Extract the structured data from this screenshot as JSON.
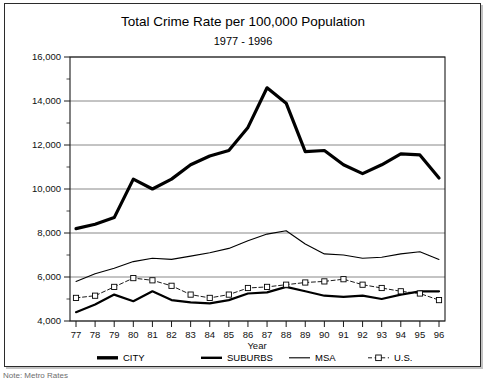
{
  "figure": {
    "title": "Total Crime Rate per 100,000 Population",
    "subtitle": "1977 - 1996",
    "caption_partial": "Note: Metro Rates",
    "border_color": "#2b2b2b",
    "background": "#ffffff"
  },
  "chart_data": {
    "type": "line",
    "title": "Total Crime Rate per 100,000 Population",
    "subtitle": "1977 - 1996",
    "xlabel": "Year",
    "ylabel": "",
    "grid": true,
    "legend_position": "bottom",
    "ylim": [
      4000,
      16000
    ],
    "ytick_step": 2000,
    "yminor_step": 1000,
    "ytick_labels": [
      "4,000",
      "6,000",
      "8,000",
      "10,000",
      "12,000",
      "14,000",
      "16,000"
    ],
    "ytick_values": [
      4000,
      6000,
      8000,
      10000,
      12000,
      14000,
      16000
    ],
    "categories": [
      "77",
      "78",
      "79",
      "80",
      "81",
      "82",
      "83",
      "84",
      "85",
      "86",
      "87",
      "88",
      "89",
      "90",
      "91",
      "92",
      "93",
      "94",
      "95",
      "96"
    ],
    "x": [
      1977,
      1978,
      1979,
      1980,
      1981,
      1982,
      1983,
      1984,
      1985,
      1986,
      1987,
      1988,
      1989,
      1990,
      1991,
      1992,
      1993,
      1994,
      1995,
      1996
    ],
    "series": [
      {
        "name": "CITY",
        "style": "solid",
        "width": 3.2,
        "color": "#000000",
        "marker": "none",
        "values": [
          8200,
          8400,
          8700,
          10450,
          10000,
          10450,
          11100,
          11500,
          11750,
          12800,
          14600,
          13900,
          11700,
          11750,
          11100,
          10700,
          11100,
          11600,
          11550,
          10500
        ]
      },
      {
        "name": "SUBURBS",
        "style": "solid",
        "width": 2.2,
        "color": "#000000",
        "marker": "none",
        "values": [
          4400,
          4750,
          5200,
          4900,
          5350,
          4950,
          4850,
          4800,
          4950,
          5250,
          5300,
          5550,
          5350,
          5150,
          5100,
          5150,
          5000,
          5200,
          5350,
          5350
        ]
      },
      {
        "name": "MSA",
        "style": "solid",
        "width": 1.1,
        "color": "#000000",
        "marker": "none",
        "values": [
          5800,
          6150,
          6400,
          6700,
          6850,
          6800,
          6950,
          7100,
          7300,
          7650,
          7950,
          8100,
          7500,
          7050,
          7000,
          6850,
          6900,
          7050,
          7150,
          6800
        ]
      },
      {
        "name": "U.S.",
        "style": "dashed",
        "width": 0.9,
        "color": "#000000",
        "marker": "square",
        "values": [
          5050,
          5150,
          5550,
          5950,
          5850,
          5600,
          5200,
          5050,
          5200,
          5500,
          5550,
          5650,
          5750,
          5800,
          5900,
          5650,
          5500,
          5350,
          5250,
          4950
        ]
      }
    ]
  },
  "legend": {
    "items": [
      {
        "label": "CITY",
        "style": "thick",
        "marker": "none"
      },
      {
        "label": "SUBURBS",
        "style": "medium",
        "marker": "none"
      },
      {
        "label": "MSA",
        "style": "thin",
        "marker": "none"
      },
      {
        "label": "U.S.",
        "style": "dashed",
        "marker": "square"
      }
    ]
  }
}
